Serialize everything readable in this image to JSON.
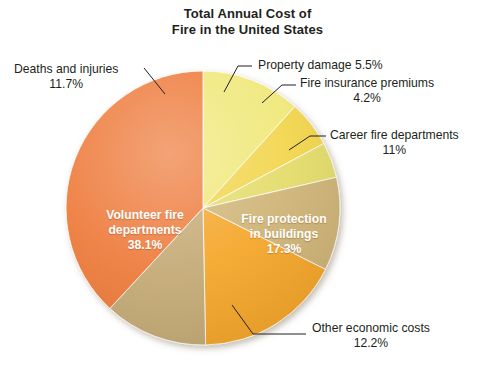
{
  "chart_data": {
    "type": "pie",
    "title": "Total Annual Cost of Fire in the United States",
    "title_line1": "Total Annual Cost of",
    "title_line2": "Fire in the United States",
    "xlabel": "",
    "ylabel": "",
    "legend_position": "none",
    "grid": false,
    "units": "percent",
    "categories": [
      "Deaths and injuries",
      "Property damage",
      "Fire insurance premiums",
      "Career fire departments",
      "Fire protection in buildings",
      "Other economic costs",
      "Volunteer fire departments"
    ],
    "values": [
      11.7,
      5.5,
      4.2,
      11.0,
      17.3,
      12.2,
      38.1
    ],
    "slices": [
      {
        "label": "Deaths and injuries",
        "value": 11.7,
        "value_text": "11.7%",
        "color": "#F0E87A",
        "label_placement": "outside-left",
        "start_angle": 0.0,
        "end_angle": 42.12
      },
      {
        "label": "Property damage",
        "value": 5.5,
        "value_text": "5.5%",
        "color": "#F2D54E",
        "label_placement": "outside-top",
        "start_angle": 42.12,
        "end_angle": 61.92
      },
      {
        "label": "Fire insurance premiums",
        "value": 4.2,
        "value_text": "4.2%",
        "color": "#E4DC6A",
        "label_placement": "outside-top-right",
        "start_angle": 61.92,
        "end_angle": 77.04
      },
      {
        "label": "Career fire departments",
        "value": 11.0,
        "value_text": "11%",
        "color": "#CFB476",
        "label_placement": "outside-right",
        "start_angle": 77.04,
        "end_angle": 116.64
      },
      {
        "label": "Fire protection in buildings",
        "value": 17.3,
        "value_text": "17.3%",
        "color": "#F5A62A",
        "label_placement": "inside",
        "start_angle": 116.64,
        "end_angle": 178.92
      },
      {
        "label": "Other economic costs",
        "value": 12.2,
        "value_text": "12.2%",
        "color": "#C5AA76",
        "label_placement": "outside-bottom",
        "start_angle": 178.92,
        "end_angle": 222.84
      },
      {
        "label": "Volunteer fire departments",
        "value": 38.1,
        "value_text": "38.1%",
        "color": "#EE7B3C",
        "label_placement": "inside",
        "start_angle": 222.84,
        "end_angle": 360.0
      }
    ]
  },
  "title": {
    "line1": "Total Annual Cost of",
    "line2": "Fire in the United States"
  },
  "callouts": {
    "deaths": {
      "label": "Deaths and injuries",
      "pct": "11.7%"
    },
    "property": {
      "label": "Property damage 5.5%",
      "pct": ""
    },
    "insurance": {
      "label": "Fire insurance premiums",
      "pct": "4.2%"
    },
    "career": {
      "label": "Career fire departments",
      "pct": "11%"
    },
    "other": {
      "label": "Other economic costs",
      "pct": "12.2%"
    }
  },
  "inner_labels": {
    "volunteer": {
      "line1": "Volunteer fire",
      "line2": "departments",
      "pct": "38.1%"
    },
    "protection": {
      "line1": "Fire protection",
      "line2": "in buildings",
      "pct": "17.3%"
    }
  },
  "colors": {
    "deaths": "#F0E87A",
    "property": "#F2D54E",
    "insurance": "#E4DC6A",
    "career": "#CFB476",
    "protection": "#F5A62A",
    "other": "#C5AA76",
    "volunteer": "#EE7B3C",
    "text": "#231f20",
    "background": "#ffffff"
  }
}
